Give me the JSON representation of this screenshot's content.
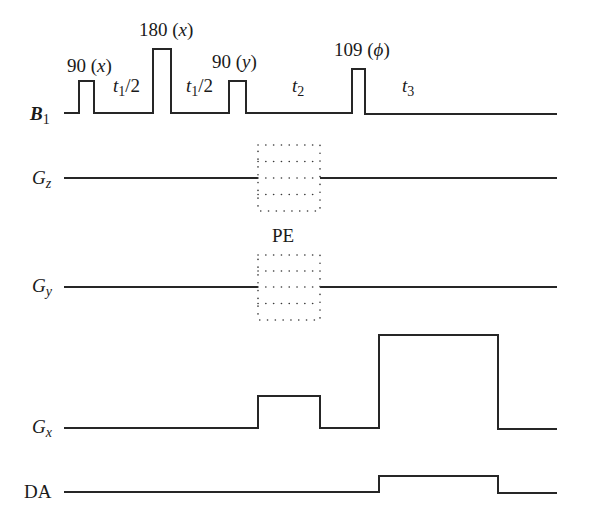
{
  "diagram": {
    "type": "pulse-sequence",
    "rows": [
      {
        "id": "b1",
        "symbol": "B",
        "subscript": "1",
        "style": "bold-italic"
      },
      {
        "id": "gz",
        "symbol": "G",
        "subscript": "z",
        "style": "italic"
      },
      {
        "id": "gy",
        "symbol": "G",
        "subscript": "y",
        "style": "italic"
      },
      {
        "id": "gx",
        "symbol": "G",
        "subscript": "x",
        "style": "italic"
      },
      {
        "id": "da",
        "symbol": "DA",
        "subscript": "",
        "style": "roman"
      }
    ],
    "rf_pulses": [
      {
        "angle": "90",
        "phase": "x",
        "label": "90 (x)"
      },
      {
        "angle": "180",
        "phase": "x",
        "label": "180 (x)"
      },
      {
        "angle": "90",
        "phase": "y",
        "label": "90 (y)"
      },
      {
        "angle": "109",
        "phase": "ϕ",
        "label": "109 (ϕ)"
      }
    ],
    "delays": [
      {
        "symbol": "t",
        "subscript": "1",
        "suffix": "/2"
      },
      {
        "symbol": "t",
        "subscript": "1",
        "suffix": "/2"
      },
      {
        "symbol": "t",
        "subscript": "2",
        "suffix": ""
      },
      {
        "symbol": "t",
        "subscript": "3",
        "suffix": ""
      }
    ],
    "phase_encode_label": "PE",
    "pulse_labels": {
      "p1_num": "90",
      "p1_phase": "x",
      "p2_num": "180",
      "p2_phase": "x",
      "p3_num": "90",
      "p3_phase": "y",
      "p4_num": "109",
      "p4_phase": "ϕ"
    },
    "row_labels": {
      "b1_main": "B",
      "b1_sub": "1",
      "gz_main": "G",
      "gz_sub": "z",
      "gy_main": "G",
      "gy_sub": "y",
      "gx_main": "G",
      "gx_sub": "x",
      "da_main": "DA"
    },
    "delay_labels": {
      "d1_t": "t",
      "d1_sub": "1",
      "d1_suffix": "/2",
      "d2_t": "t",
      "d2_sub": "1",
      "d2_suffix": "/2",
      "d3_t": "t",
      "d3_sub": "2",
      "d4_t": "t",
      "d4_sub": "3"
    },
    "colors": {
      "line": "#262626",
      "text": "#1a1a1a",
      "background": "#ffffff"
    }
  }
}
